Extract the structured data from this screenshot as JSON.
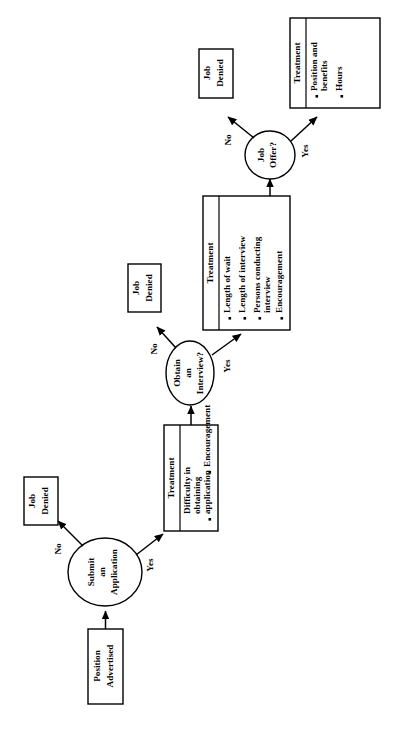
{
  "diagram": {
    "orientation": "rotated-90-ccw",
    "nodes": {
      "start": {
        "name": "position-advertised",
        "line1": "Position",
        "line2": "Advertised",
        "shape": "rectangle"
      },
      "decision1": {
        "name": "submit-an-application",
        "line1": "Submit",
        "line2": "an",
        "line3": "Application",
        "shape": "ellipse"
      },
      "decision2": {
        "name": "obtain-an-interview",
        "line1": "Obtain",
        "line2": "an",
        "line3": "Interview?",
        "shape": "ellipse"
      },
      "decision3": {
        "name": "job-offer",
        "line1": "Job",
        "line2": "Offer?",
        "shape": "ellipse"
      },
      "denied1": {
        "name": "job-denied-1",
        "line1": "Job",
        "line2": "Denied",
        "shape": "rectangle"
      },
      "denied2": {
        "name": "job-denied-2",
        "line1": "Job",
        "line2": "Denied",
        "shape": "rectangle"
      },
      "denied3": {
        "name": "job-denied-3",
        "line1": "Job",
        "line2": "Denied",
        "shape": "rectangle"
      }
    },
    "treatments": [
      {
        "name": "treatment-application",
        "header": "Treatment",
        "items": [
          [
            "Difficulty in",
            "obtaining",
            "application"
          ],
          [
            "Encouragement"
          ]
        ]
      },
      {
        "name": "treatment-interview",
        "header": "Treatment",
        "items": [
          [
            "Length of wait"
          ],
          [
            "Length of interview"
          ],
          [
            "Persons conducting",
            "interview"
          ],
          [
            "Encouragement"
          ]
        ]
      },
      {
        "name": "treatment-offer",
        "header": "Treatment",
        "items": [
          [
            "Position and",
            "benefits"
          ],
          [
            "Hours"
          ]
        ]
      }
    ],
    "edge_labels": {
      "no1": "No",
      "yes1": "Yes",
      "no2": "No",
      "yes2": "Yes",
      "no3": "No",
      "yes3": "Yes"
    },
    "colors": {
      "stroke": "#000000",
      "fill": "#ffffff",
      "background": "#ffffff"
    }
  }
}
